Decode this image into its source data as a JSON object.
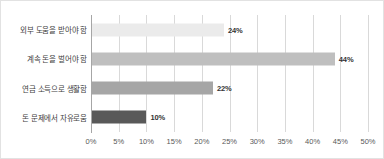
{
  "chart_data": {
    "type": "bar",
    "orientation": "horizontal",
    "title": "",
    "xlabel": "",
    "ylabel": "",
    "xlim": [
      0,
      50
    ],
    "grid": true,
    "legend": false,
    "categories": [
      "외부 도움을 받아야 함",
      "계속 돈을 벌어야 함",
      "연금 소득으로 생활함",
      "돈 문제에서 자유로움"
    ],
    "values": [
      24,
      44,
      22,
      10
    ],
    "value_labels": [
      "24%",
      "44%",
      "22%",
      "10%"
    ],
    "bar_colors": [
      "#ebebeb",
      "#bfbfbf",
      "#a6a6a6",
      "#595959"
    ],
    "xticks": [
      0,
      5,
      10,
      15,
      20,
      25,
      30,
      35,
      40,
      45,
      50
    ],
    "xtick_labels": [
      "0%",
      "5%",
      "10%",
      "15%",
      "20%",
      "25%",
      "30%",
      "35%",
      "40%",
      "45%",
      "50%"
    ]
  },
  "style": {
    "background": "#ffffff",
    "border_color": "#e2e2e2",
    "gridline_color": "#d9d9d9",
    "axis_color": "#a6a6a6",
    "label_color": "#404040",
    "tick_color": "#595959",
    "value_color": "#333333"
  }
}
